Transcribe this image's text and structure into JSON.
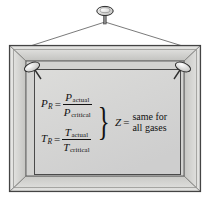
{
  "figure": {
    "frame_color": "#c9c9c6",
    "frame_edge_color": "#4a4a4a",
    "sheet_color": "#d4d4d2",
    "wall_color": "#ffffff",
    "ink_color": "#111111"
  },
  "hardware": {
    "hook_nail": "nail-icon",
    "left_tack": "tack-icon",
    "right_tack": "tack-icon",
    "wire": "hanging-wire"
  },
  "equations": [
    {
      "id": "reduced-pressure",
      "lhs_symbol": "P",
      "lhs_subscript": "R",
      "equals": "=",
      "numerator_symbol": "P",
      "numerator_subscript": "actual",
      "denominator_symbol": "P",
      "denominator_subscript": "critical"
    },
    {
      "id": "reduced-temperature",
      "lhs_symbol": "T",
      "lhs_subscript": "R",
      "equals": "=",
      "numerator_symbol": "T",
      "numerator_subscript": "actual",
      "denominator_symbol": "T",
      "denominator_subscript": "critical"
    }
  ],
  "brace": "}",
  "conclusion": {
    "symbol": "Z",
    "equals": "=",
    "line1": "same for",
    "line2": "all gases"
  }
}
